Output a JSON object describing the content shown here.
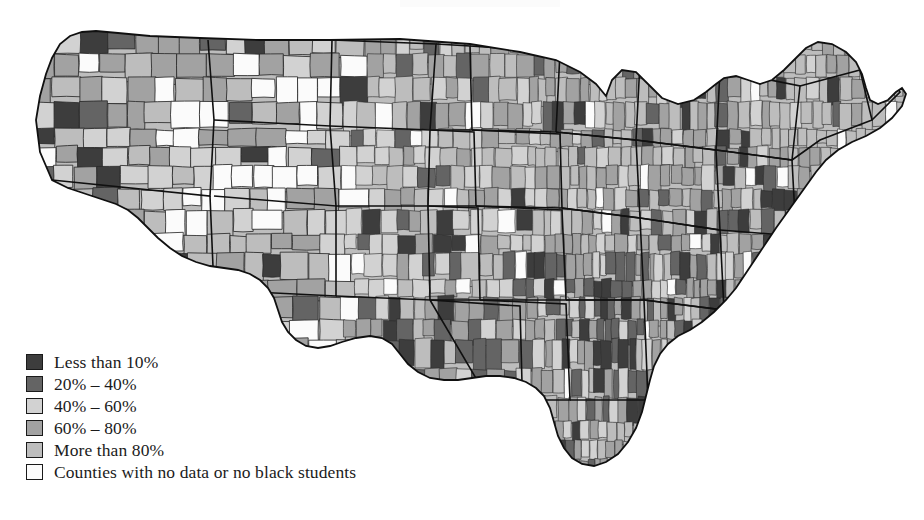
{
  "figure": {
    "type": "choropleth-map",
    "region": "Contiguous United States",
    "unit": "county",
    "background_color": "#ffffff",
    "outline_color": "#1a1a1a"
  },
  "legend": {
    "name": "map-legend",
    "items": [
      {
        "label": "Less than 10%",
        "color": "#3d3d3d",
        "swatch_name": "legend-swatch-less-than-10"
      },
      {
        "label": "20% – 40%",
        "color": "#646464",
        "swatch_name": "legend-swatch-20-40"
      },
      {
        "label": "40% – 60%",
        "color": "#d2d2d2",
        "swatch_name": "legend-swatch-40-60"
      },
      {
        "label": "60% – 80%",
        "color": "#a2a2a2",
        "swatch_name": "legend-swatch-60-80"
      },
      {
        "label": "More than 80%",
        "color": "#bdbdbd",
        "swatch_name": "legend-swatch-more-than-80"
      },
      {
        "label": "Counties with no data or no black students",
        "color": "#fbfbfb",
        "swatch_name": "legend-swatch-no-data"
      }
    ]
  },
  "chart_data": {
    "type": "heatmap",
    "title": "",
    "subtitle": "",
    "xlabel": "",
    "ylabel": "",
    "grid": false,
    "legend_position": "bottom-left",
    "categories": [
      "Less than 10%",
      "20% – 40%",
      "40% – 60%",
      "60% – 80%",
      "More than 80%",
      "Counties with no data or no black students"
    ],
    "colors": [
      "#3d3d3d",
      "#646464",
      "#d2d2d2",
      "#a2a2a2",
      "#bdbdbd",
      "#fbfbfb"
    ],
    "bins": [
      {
        "label": "Less than 10%",
        "min": 0,
        "max": 10,
        "color": "#3d3d3d"
      },
      {
        "label": "20% – 40%",
        "min": 20,
        "max": 40,
        "color": "#646464"
      },
      {
        "label": "40% – 60%",
        "min": 40,
        "max": 60,
        "color": "#d2d2d2"
      },
      {
        "label": "60% – 80%",
        "min": 60,
        "max": 80,
        "color": "#a2a2a2"
      },
      {
        "label": "More than 80%",
        "min": 80,
        "max": 100,
        "color": "#bdbdbd"
      },
      {
        "label": "Counties with no data or no black students",
        "min": null,
        "max": null,
        "color": "#fbfbfb"
      }
    ],
    "regional_summary": [
      {
        "region": "Pacific Northwest (WA, OR)",
        "dominant_category": "60% – 80%"
      },
      {
        "region": "Northern Rockies / Great Basin (ID, MT, WY, NV, UT)",
        "dominant_category": "Counties with no data or no black students"
      },
      {
        "region": "California",
        "dominant_category": "60% – 80%"
      },
      {
        "region": "Southwest (AZ, NM)",
        "dominant_category": "40% – 60%"
      },
      {
        "region": "Great Plains (ND, SD, NE, KS)",
        "dominant_category": "40% – 60%"
      },
      {
        "region": "Upper Midwest (MN, WI, MI)",
        "dominant_category": "60% – 80%"
      },
      {
        "region": "Corn Belt (IA, IL, IN, OH)",
        "dominant_category": "60% – 80%"
      },
      {
        "region": "Texas",
        "dominant_category": "60% – 80%"
      },
      {
        "region": "Deep South (MS, AL, GA, SC, LA)",
        "dominant_category": "20% – 40%"
      },
      {
        "region": "Appalachia (KY, TN, WV, VA)",
        "dominant_category": "40% – 60%"
      },
      {
        "region": "Mid-Atlantic (PA, NY, NJ, MD)",
        "dominant_category": "60% – 80%"
      },
      {
        "region": "New England (ME, NH, VT, MA, CT, RI)",
        "dominant_category": "More than 80%"
      },
      {
        "region": "Florida",
        "dominant_category": "60% – 80%"
      }
    ]
  }
}
